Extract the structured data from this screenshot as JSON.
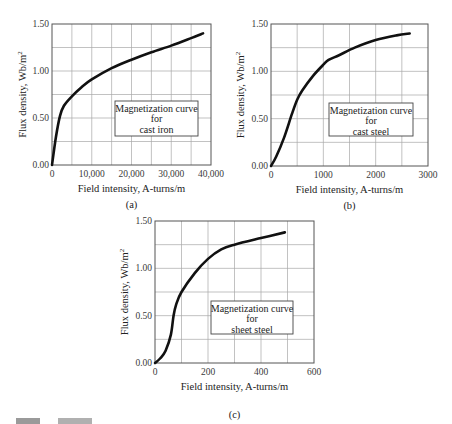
{
  "figure": {
    "charts": [
      {
        "id": "a",
        "caption": "(a)",
        "legend": [
          "Magnetization curve",
          "for",
          "cast iron"
        ]
      },
      {
        "id": "b",
        "caption": "(b)",
        "legend": [
          "Magnetization curve",
          "for",
          "cast steel"
        ]
      },
      {
        "id": "c",
        "caption": "(c)",
        "legend": [
          "Magnetization curve",
          "for",
          "sheet steel"
        ]
      }
    ]
  },
  "chart_data": [
    {
      "type": "line",
      "title": "Magnetization curve for cast iron",
      "caption": "(a)",
      "xlabel": "Field intensity, A-turns/m",
      "ylabel": "Flux density, Wb/m²",
      "xlim": [
        0,
        40000
      ],
      "ylim": [
        0,
        1.5
      ],
      "xticks": [
        "0",
        "10,000",
        "20,000",
        "30,000",
        "40,000"
      ],
      "yticks": [
        "0.00",
        "0.50",
        "1.00",
        "1.50"
      ],
      "grid": true,
      "grid_x_step": 5000,
      "grid_y_step": 0.25,
      "legend": "Magnetization curve for cast iron",
      "legend_position": "center-right",
      "x": [
        0,
        1000,
        2000,
        3000,
        5000,
        7500,
        10000,
        15000,
        20000,
        25000,
        30000,
        35000,
        38000
      ],
      "y": [
        0.0,
        0.3,
        0.52,
        0.63,
        0.73,
        0.83,
        0.91,
        1.03,
        1.12,
        1.2,
        1.27,
        1.35,
        1.4
      ]
    },
    {
      "type": "line",
      "title": "Magnetization curve for cast steel",
      "caption": "(b)",
      "xlabel": "Field intensity, A-turns/m",
      "ylabel": "Flux density, Wb/m²",
      "xlim": [
        0,
        3000
      ],
      "ylim": [
        0,
        1.5
      ],
      "xticks": [
        "0",
        "1000",
        "2000",
        "3000"
      ],
      "yticks": [
        "0.00",
        "0.50",
        "1.00",
        "1.50"
      ],
      "grid": true,
      "grid_x_step": 500,
      "grid_y_step": 0.25,
      "legend": "Magnetization curve for cast steel",
      "legend_position": "center-right",
      "x": [
        0,
        100,
        250,
        400,
        500,
        600,
        800,
        1000,
        1100,
        1300,
        1600,
        2000,
        2400,
        2650
      ],
      "y": [
        0.0,
        0.1,
        0.3,
        0.55,
        0.7,
        0.8,
        0.95,
        1.07,
        1.12,
        1.17,
        1.25,
        1.33,
        1.38,
        1.4
      ]
    },
    {
      "type": "line",
      "title": "Magnetization curve for sheet steel",
      "caption": "(c)",
      "xlabel": "Field intensity, A-turns/m",
      "ylabel": "Flux density, Wb/m²",
      "xlim": [
        0,
        600
      ],
      "ylim": [
        0,
        1.5
      ],
      "xticks": [
        "0",
        "200",
        "400",
        "600"
      ],
      "yticks": [
        "0.00",
        "0.50",
        "1.00",
        "1.50"
      ],
      "grid": true,
      "grid_x_step": 100,
      "grid_y_step": 0.25,
      "legend": "Magnetization curve for sheet steel",
      "legend_position": "center-right",
      "x": [
        0,
        20,
        40,
        60,
        70,
        80,
        100,
        150,
        200,
        250,
        300,
        400,
        490
      ],
      "y": [
        0.0,
        0.05,
        0.13,
        0.3,
        0.5,
        0.62,
        0.75,
        0.95,
        1.1,
        1.2,
        1.25,
        1.32,
        1.38
      ]
    }
  ]
}
